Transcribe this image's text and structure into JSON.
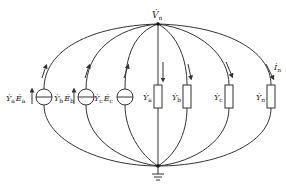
{
  "diagram": {
    "top_node_label": "V̇",
    "top_node_sub": "n",
    "ground_symbol": "ground-icon",
    "sources": [
      {
        "label_Y": "Ẏ",
        "Y_sub": "a",
        "label_E": "Ė",
        "E_sub": "a",
        "x": 44
      },
      {
        "label_Y": "Ẏ",
        "Y_sub": "b",
        "label_E": "Ė",
        "E_sub": "b",
        "x": 86
      },
      {
        "label_Y": "Ẏ",
        "Y_sub": "c",
        "label_E": "Ė",
        "E_sub": "c",
        "x": 125
      }
    ],
    "admittances": [
      {
        "label": "Ẏ",
        "sub": "a",
        "x": 158
      },
      {
        "label": "Ẏ",
        "sub": "b",
        "x": 187
      },
      {
        "label": "Ẏ",
        "sub": "c",
        "x": 229
      },
      {
        "label": "Ẏ",
        "sub": "n",
        "x": 271
      }
    ],
    "current_label": "İ",
    "current_sub": "n",
    "colors": {
      "line": "#333333",
      "background": "#ffffff"
    }
  }
}
